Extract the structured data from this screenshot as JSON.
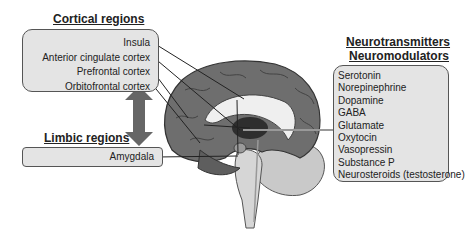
{
  "cortical": {
    "title": "Cortical regions",
    "items": [
      "Insula",
      "Anterior cingulate cortex",
      "Prefrontal cortex",
      "Orbitofrontal cortex"
    ]
  },
  "limbic": {
    "title": "Limbic regions",
    "items": [
      "Amygdala"
    ]
  },
  "neuro": {
    "title_line1": "Neurotransmitters",
    "title_line2": "Neuromodulators",
    "items": [
      "Serotonin",
      "Norepinephrine",
      "Dopamine",
      "GABA",
      "Glutamate",
      "Oxytocin",
      "Vasopressin",
      "Substance P",
      "Neurosteroids (testosterone)"
    ]
  },
  "colors": {
    "box_fill": "#e4e4e4",
    "box_border": "#555555",
    "arrow": "#666666",
    "brain_cortex": "#6e6e6e",
    "brainstem": "#c8c8c8"
  }
}
